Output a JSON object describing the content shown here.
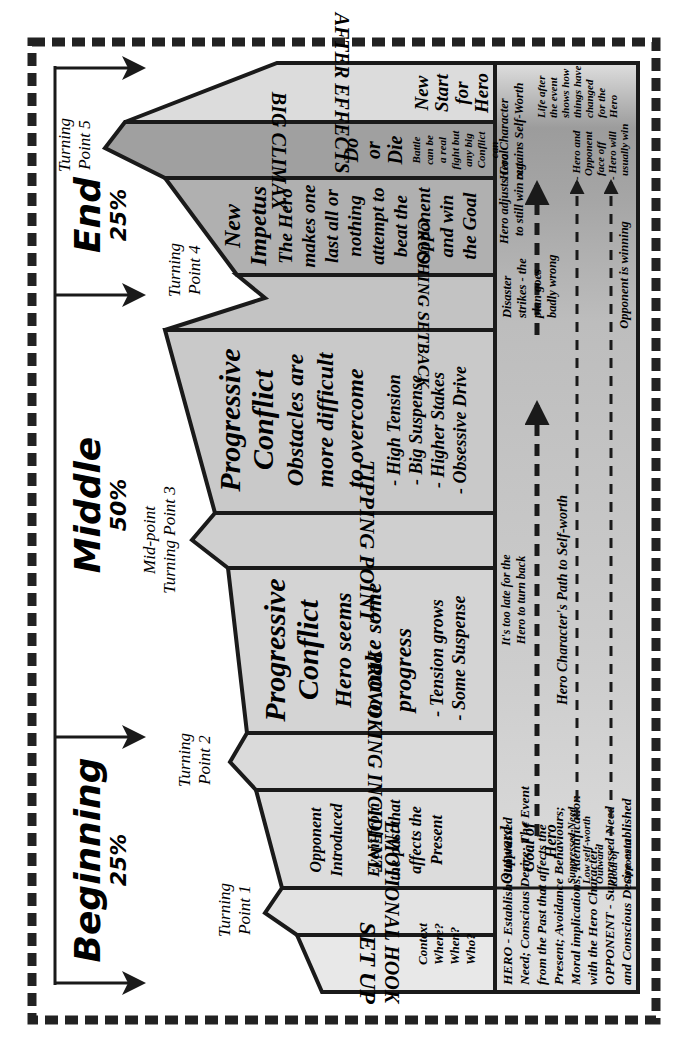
{
  "diagram": {
    "acts": [
      {
        "label": "Beginning",
        "percent": "25%"
      },
      {
        "label": "Middle",
        "percent": "50%"
      },
      {
        "label": "End",
        "percent": "25%"
      }
    ],
    "turning_points": [
      {
        "line1": "Turning",
        "line2": "Point 1"
      },
      {
        "line1": "Turning",
        "line2": "Point 2"
      },
      {
        "line1": "Mid-point",
        "line2": "Turning Point 3"
      },
      {
        "line1": "Turning",
        "line2": "Point 4"
      },
      {
        "line1": "Turning",
        "line2": "Point 5"
      }
    ],
    "stages": {
      "set_up": {
        "title": "SET UP",
        "note": [
          "Context",
          "Where?",
          "When?",
          "Who?"
        ]
      },
      "emotional_hook": {
        "title": "EMOTIONAL HOOK"
      },
      "opponent_introduced": {
        "lines": [
          "Opponent",
          "Introduced",
          "",
          "Event from",
          "the past that",
          "affects the",
          "Present"
        ]
      },
      "provoking_incident": {
        "title": "PROVOKING INCIDENT"
      },
      "progressive_conflict_1": {
        "heading": [
          "Progressive",
          "Conflict"
        ],
        "lines": [
          "Hero seems",
          "to make some",
          "progress"
        ],
        "bullets": [
          "- Tension grows",
          "- Some Suspense"
        ]
      },
      "tipping_point": {
        "title": "TIPPING POINT"
      },
      "progressive_conflict_2": {
        "heading": [
          "Progressive",
          "Conflict"
        ],
        "lines": [
          "Obstacles are",
          "more difficult",
          "to overcome"
        ],
        "bullets": [
          "- High Tension",
          "- Big Suspense",
          "- Higher Stakes",
          "- Obsessive Drive"
        ]
      },
      "crushing_setback": {
        "title": "CRUSHING SETBACK"
      },
      "new_impetus": {
        "heading": [
          "New",
          "Impetus"
        ],
        "lines": [
          "The Hero",
          "makes one",
          "last all or",
          "nothing",
          "attempt to",
          "beat the",
          "Opponent",
          "and win",
          "the Goal"
        ]
      },
      "big_climax": {
        "title": "BIG CLIMAX",
        "heading": [
          "Do",
          "or",
          "Die"
        ],
        "lines": [
          "Battle",
          "can be",
          "a real",
          "fight but",
          "any big",
          "Conflict",
          "can",
          "count"
        ]
      },
      "after_effects": {
        "title": "AFTER EFFECTS",
        "heading": [
          "New",
          "Start",
          "for",
          "Hero"
        ]
      }
    },
    "bottom_band": {
      "hero_opponent_intro": [
        "HERO -  Establish Suppressed",
        "Need; Conscious Desire; The Event",
        "from the Past that affects the",
        "Present; Avoidance Behaviours;",
        "Moral implications; Identification",
        "with the Hero Character.",
        "OPPONENT -  Suppressed Need",
        "and Conscious Desire established"
      ],
      "outward_goal_hero": [
        "Outward",
        "Goal of",
        "Hero"
      ],
      "suppressed_need": [
        "Suppressed Need",
        "Low self-worth"
      ],
      "outward_goal_opponent": [
        "Outward",
        "Goal of",
        "Opponent"
      ],
      "too_late": [
        "It's too late for the",
        "Hero to turn back"
      ],
      "path_to_self_worth": "Hero Character's Path to Self-worth",
      "disaster": [
        "Disaster",
        "strikes - the",
        "plan goes",
        "badly wrong"
      ],
      "opponent_winning": "Opponent is winning",
      "hero_adjusts": [
        "Hero adjusts Goal",
        "to still win out"
      ],
      "face_off": [
        "- Hero and",
        "Opponent",
        "face off",
        "- Hero will",
        "usually win"
      ],
      "regains": [
        "Hero Character",
        "regains Self-Worth"
      ],
      "life_after": [
        "Life after",
        "the event",
        "shows how",
        "things have",
        "changed",
        "for the",
        "Hero"
      ]
    },
    "colors": {
      "light": "#e6e6e6",
      "mid": "#cfcfcf",
      "dark": "#b3b3b3",
      "darker": "#9e9e9e",
      "stroke": "#1a1a1a"
    }
  }
}
